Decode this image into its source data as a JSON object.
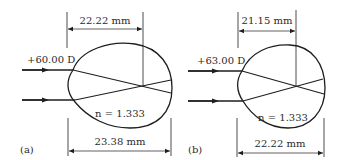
{
  "panels": [
    {
      "id": "a",
      "caption": "(a)",
      "power_label": "+60.00 D",
      "focal_distance_label": "22.22 mm",
      "axial_length_label": "23.38 mm",
      "refractive_index_label": "n = 1.333"
    },
    {
      "id": "b",
      "caption": "(b)",
      "power_label": "+63.00 D",
      "focal_distance_label": "21.15 mm",
      "axial_length_label": "22.22 mm",
      "refractive_index_label": "n = 1.333"
    }
  ],
  "colors": {
    "line": "#1e1e1e",
    "background": "#ffffff"
  }
}
